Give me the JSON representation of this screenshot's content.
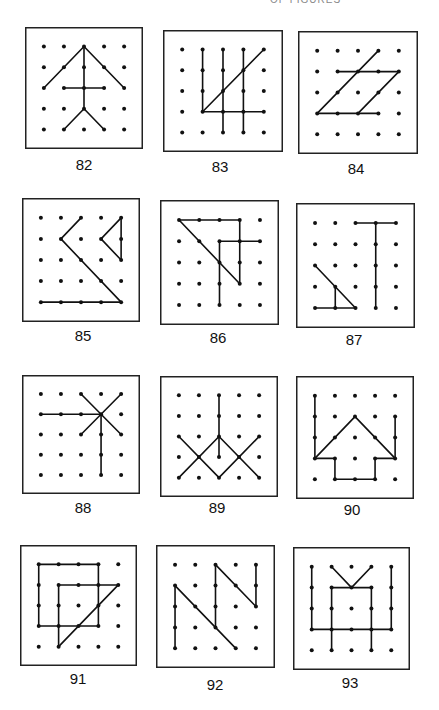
{
  "header": {
    "text": "OF FIGURES"
  },
  "grid": {
    "rows": 5,
    "cols": 5
  },
  "colors": {
    "ink": "#111111",
    "border": "#222222",
    "background": "#ffffff"
  },
  "figures": [
    {
      "label": "82",
      "box": [
        25,
        27,
        118,
        122
      ],
      "label_pos": [
        54,
        156
      ],
      "segments": [
        [
          2,
          0,
          0,
          2
        ],
        [
          2,
          0,
          4,
          2
        ],
        [
          2,
          0,
          2,
          3
        ],
        [
          1,
          2,
          3,
          2
        ],
        [
          2,
          3,
          1,
          4
        ],
        [
          2,
          3,
          3,
          4
        ]
      ]
    },
    {
      "label": "83",
      "box": [
        163,
        30,
        120,
        122
      ],
      "label_pos": [
        190,
        158
      ],
      "segments": [
        [
          1,
          0,
          1,
          3
        ],
        [
          2,
          0,
          2,
          4
        ],
        [
          3,
          0,
          3,
          4
        ],
        [
          1,
          3,
          4,
          0
        ],
        [
          1,
          3,
          4,
          3
        ]
      ]
    },
    {
      "label": "84",
      "box": [
        298,
        31,
        120,
        123
      ],
      "label_pos": [
        326,
        160
      ],
      "segments": [
        [
          3,
          0,
          0,
          3
        ],
        [
          1,
          1,
          4,
          1
        ],
        [
          4,
          1,
          2,
          3
        ],
        [
          0,
          3,
          3,
          3
        ]
      ]
    },
    {
      "label": "85",
      "box": [
        22,
        198,
        118,
        124
      ],
      "label_pos": [
        53,
        327
      ],
      "segments": [
        [
          2,
          0,
          1,
          1
        ],
        [
          1,
          1,
          4,
          4
        ],
        [
          0,
          4,
          4,
          4
        ],
        [
          4,
          0,
          3,
          1
        ],
        [
          3,
          1,
          4,
          2
        ],
        [
          4,
          0,
          4,
          2
        ]
      ]
    },
    {
      "label": "86",
      "box": [
        160,
        200,
        119,
        125
      ],
      "label_pos": [
        188,
        329
      ],
      "segments": [
        [
          0,
          0,
          3,
          0
        ],
        [
          3,
          0,
          3,
          3
        ],
        [
          0,
          0,
          3,
          3
        ],
        [
          2,
          4,
          2,
          1
        ],
        [
          2,
          1,
          4,
          1
        ]
      ]
    },
    {
      "label": "87",
      "box": [
        296,
        203,
        119,
        125
      ],
      "label_pos": [
        324,
        331
      ],
      "segments": [
        [
          2,
          0,
          4,
          0
        ],
        [
          3,
          0,
          3,
          4
        ],
        [
          0,
          2,
          2,
          4
        ],
        [
          0,
          4,
          2,
          4
        ],
        [
          1,
          3,
          1,
          4
        ]
      ]
    },
    {
      "label": "88",
      "box": [
        22,
        375,
        118,
        119
      ],
      "label_pos": [
        53,
        499
      ],
      "segments": [
        [
          0,
          1,
          3,
          1
        ],
        [
          2,
          0,
          4,
          2
        ],
        [
          4,
          0,
          2,
          2
        ],
        [
          3,
          1,
          3,
          4
        ]
      ]
    },
    {
      "label": "89",
      "box": [
        160,
        376,
        118,
        121
      ],
      "label_pos": [
        187,
        499
      ],
      "segments": [
        [
          2,
          0,
          2,
          3
        ],
        [
          0,
          2,
          2,
          4
        ],
        [
          2,
          4,
          4,
          2
        ],
        [
          0,
          4,
          2,
          2
        ],
        [
          2,
          2,
          4,
          4
        ]
      ]
    },
    {
      "label": "90",
      "box": [
        296,
        376,
        118,
        123
      ],
      "label_pos": [
        322,
        501
      ],
      "segments": [
        [
          0,
          0,
          0,
          3
        ],
        [
          4,
          1,
          4,
          3
        ],
        [
          0,
          3,
          2,
          1
        ],
        [
          2,
          1,
          4,
          3
        ],
        [
          0,
          3,
          1,
          3
        ],
        [
          1,
          3,
          1,
          4
        ],
        [
          1,
          4,
          3,
          4
        ],
        [
          3,
          4,
          3,
          3
        ],
        [
          3,
          3,
          4,
          3
        ]
      ]
    },
    {
      "label": "91",
      "box": [
        20,
        545,
        117,
        121
      ],
      "label_pos": [
        48,
        670
      ],
      "segments": [
        [
          0,
          0,
          3,
          0
        ],
        [
          3,
          0,
          3,
          3
        ],
        [
          3,
          3,
          0,
          3
        ],
        [
          0,
          3,
          0,
          0
        ],
        [
          1,
          4,
          1,
          1
        ],
        [
          1,
          1,
          4,
          1
        ],
        [
          4,
          1,
          1,
          4
        ]
      ]
    },
    {
      "label": "92",
      "box": [
        156,
        545,
        119,
        123
      ],
      "label_pos": [
        185,
        676
      ],
      "segments": [
        [
          0,
          1,
          0,
          4
        ],
        [
          0,
          1,
          3,
          4
        ],
        [
          2,
          0,
          2,
          3
        ],
        [
          2,
          0,
          4,
          2
        ],
        [
          4,
          0,
          4,
          2
        ]
      ]
    },
    {
      "label": "93",
      "box": [
        293,
        547,
        117,
        123
      ],
      "label_pos": [
        320,
        674
      ],
      "segments": [
        [
          0,
          0,
          0,
          3
        ],
        [
          4,
          0,
          4,
          3
        ],
        [
          0,
          3,
          4,
          3
        ],
        [
          1,
          1,
          3,
          1
        ],
        [
          1,
          1,
          1,
          4
        ],
        [
          3,
          1,
          3,
          4
        ],
        [
          1,
          0,
          2,
          1
        ],
        [
          2,
          1,
          3,
          0
        ]
      ]
    }
  ]
}
